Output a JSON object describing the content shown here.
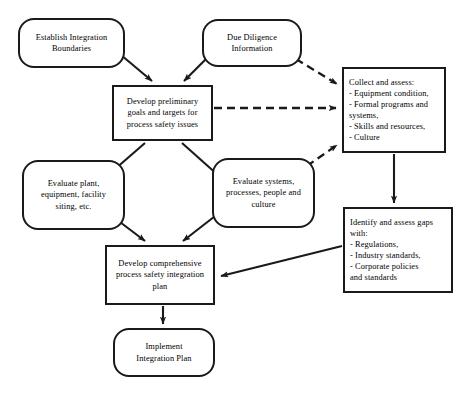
{
  "diagram": {
    "type": "flowchart",
    "nodes": [
      {
        "id": "establish-integration-boundaries",
        "shape": "rounded",
        "text": "Establish Integration\nBoundaries",
        "x": 18,
        "y": 18,
        "w": 107,
        "h": 50
      },
      {
        "id": "due-diligence-information",
        "shape": "rounded",
        "text": "Due Diligence\nInformation",
        "x": 202,
        "y": 19,
        "w": 100,
        "h": 48
      },
      {
        "id": "develop-preliminary-goals",
        "shape": "rect",
        "text": "Develop preliminary\ngoals and targets for\nprocess safety issues",
        "x": 112,
        "y": 85,
        "w": 101,
        "h": 56
      },
      {
        "id": "collect-and-assess",
        "shape": "rect-list",
        "text": "Collect and assess:\n- Equipment condition,\n- Formal programs and\nsystems,\n- Skills and resources,\n- Culture",
        "x": 342,
        "y": 67,
        "w": 104,
        "h": 86
      },
      {
        "id": "evaluate-plant-equipment",
        "shape": "rounded",
        "text": "Evaluate plant,\nequipment, facility\nsiting, etc.",
        "x": 22,
        "y": 160,
        "w": 103,
        "h": 70
      },
      {
        "id": "evaluate-systems-processes",
        "shape": "rounded",
        "text": "Evaluate systems,\nprocesses, people and\nculture",
        "x": 212,
        "y": 158,
        "w": 103,
        "h": 70
      },
      {
        "id": "identify-and-assess-gaps",
        "shape": "rect-list",
        "text": "Identify and assess gaps\nwith:\n  - Regulations,\n  - Industry standards,\n  - Corporate policies\nand standards",
        "x": 343,
        "y": 207,
        "w": 110,
        "h": 86
      },
      {
        "id": "develop-comprehensive-plan",
        "shape": "rect",
        "text": "Develop comprehensive\nprocess safety integration\nplan",
        "x": 105,
        "y": 245,
        "w": 110,
        "h": 60
      },
      {
        "id": "implement-integration-plan",
        "shape": "rounded",
        "text": "Implement\nIntegration Plan",
        "x": 113,
        "y": 328,
        "w": 102,
        "h": 49
      }
    ],
    "edges": [
      {
        "id": "edge-boundaries-to-goals",
        "from": "establish-integration-boundaries",
        "to": "develop-preliminary-goals",
        "style": "solid",
        "arrow": true
      },
      {
        "id": "edge-duediligence-to-goals",
        "from": "due-diligence-information",
        "to": "develop-preliminary-goals",
        "style": "solid",
        "arrow": true
      },
      {
        "id": "edge-duediligence-to-collect",
        "from": "due-diligence-information",
        "to": "collect-and-assess",
        "style": "dashed",
        "arrow": true
      },
      {
        "id": "edge-goals-to-collect",
        "from": "develop-preliminary-goals",
        "to": "collect-and-assess",
        "style": "dashed",
        "arrow": true
      },
      {
        "id": "edge-evalsystems-to-collect",
        "from": "evaluate-systems-processes",
        "to": "collect-and-assess",
        "style": "dashed",
        "arrow": true
      },
      {
        "id": "edge-goals-to-evalplant",
        "from": "develop-preliminary-goals",
        "to": "evaluate-plant-equipment",
        "style": "solid",
        "arrow": true
      },
      {
        "id": "edge-goals-to-evalsystems",
        "from": "develop-preliminary-goals",
        "to": "evaluate-systems-processes",
        "style": "solid",
        "arrow": true
      },
      {
        "id": "edge-evalplant-to-plan",
        "from": "evaluate-plant-equipment",
        "to": "develop-comprehensive-plan",
        "style": "solid",
        "arrow": true
      },
      {
        "id": "edge-evalsystems-to-plan",
        "from": "evaluate-systems-processes",
        "to": "develop-comprehensive-plan",
        "style": "solid",
        "arrow": true
      },
      {
        "id": "edge-collect-to-gaps",
        "from": "collect-and-assess",
        "to": "identify-and-assess-gaps",
        "style": "solid",
        "arrow": true
      },
      {
        "id": "edge-gaps-to-plan",
        "from": "identify-and-assess-gaps",
        "to": "develop-comprehensive-plan",
        "style": "solid",
        "arrow": true
      },
      {
        "id": "edge-plan-to-implement",
        "from": "develop-comprehensive-plan",
        "to": "implement-integration-plan",
        "style": "solid",
        "arrow": true
      }
    ],
    "colors": {
      "stroke": "#1a1a1a",
      "fill": "#ffffff",
      "text": "#000000"
    }
  }
}
